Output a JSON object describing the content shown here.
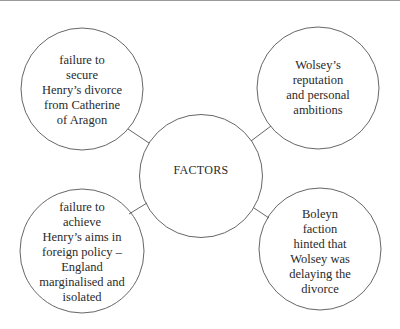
{
  "diagram": {
    "center": {
      "label": "FACTORS"
    },
    "nodes": [
      {
        "position": "top-left",
        "lines": [
          "failure to",
          "secure",
          "Henry’s divorce",
          "from Catherine",
          "of Aragon"
        ]
      },
      {
        "position": "top-right",
        "lines": [
          "Wolsey’s",
          "reputation",
          "and personal",
          "ambitions"
        ]
      },
      {
        "position": "bottom-left",
        "lines": [
          "failure to",
          "achieve",
          "Henry’s aims in",
          "foreign policy –",
          "England",
          "marginalised and",
          "isolated"
        ]
      },
      {
        "position": "bottom-right",
        "lines": [
          "Boleyn",
          "faction",
          "hinted that",
          "Wolsey was",
          "delaying the",
          "divorce"
        ]
      }
    ],
    "colors": {
      "stroke": "#555555",
      "text": "#2a2a2a",
      "background": "#ffffff"
    }
  }
}
